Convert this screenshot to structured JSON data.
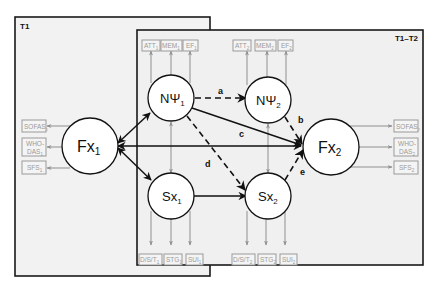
{
  "frames": {
    "t1": {
      "label": "T1"
    },
    "t1t2": {
      "label": "T1–T2"
    }
  },
  "nodes": {
    "npsi1": {
      "main": "NΨ",
      "sub": "1"
    },
    "npsi2": {
      "main": "NΨ",
      "sub": "2"
    },
    "sx1": {
      "main": "Sx",
      "sub": "1"
    },
    "sx2": {
      "main": "Sx",
      "sub": "2"
    },
    "fx1": {
      "main": "Fx",
      "sub": "1"
    },
    "fx2": {
      "main": "Fx",
      "sub": "2"
    }
  },
  "indicators": {
    "npsi1": [
      {
        "main": "ATT",
        "sub": "1"
      },
      {
        "main": "MEM",
        "sub": "1"
      },
      {
        "main": "EF",
        "sub": "1"
      }
    ],
    "npsi2": [
      {
        "main": "ATT",
        "sub": "2"
      },
      {
        "main": "MEM",
        "sub": "2"
      },
      {
        "main": "EF",
        "sub": "2"
      }
    ],
    "sx1": [
      {
        "main": "D/S/T",
        "sub": "1"
      },
      {
        "main": "STG",
        "sub": "1"
      },
      {
        "main": "SUI",
        "sub": "1"
      }
    ],
    "sx2": [
      {
        "main": "D/S/T",
        "sub": "2"
      },
      {
        "main": "STG",
        "sub": "2"
      },
      {
        "main": "SUI",
        "sub": "2"
      }
    ],
    "fx1": [
      {
        "line1": "SOFAS",
        "sub": "1"
      },
      {
        "line1": "WHO-",
        "line2": "DAS",
        "sub": "1"
      },
      {
        "line1": "SFS",
        "sub": "1"
      }
    ],
    "fx2": [
      {
        "line1": "SOFAS",
        "sub": "2"
      },
      {
        "line1": "WHO-",
        "line2": "DAS",
        "sub": "2"
      },
      {
        "line1": "SFS",
        "sub": "2"
      }
    ]
  },
  "paths": {
    "a": {
      "label": "a",
      "from": "NΨ1",
      "to": "NΨ2",
      "style": "dashed"
    },
    "b": {
      "label": "b",
      "from": "NΨ2",
      "to": "Fx2",
      "style": "dashed"
    },
    "c": {
      "label": "c",
      "from": "NΨ1",
      "to": "Fx2",
      "style": "solid"
    },
    "d": {
      "label": "d",
      "from": "NΨ1",
      "to": "Sx2",
      "style": "dashed"
    },
    "e": {
      "label": "e",
      "from": "Sx2",
      "to": "Fx2",
      "style": "dashed"
    }
  }
}
